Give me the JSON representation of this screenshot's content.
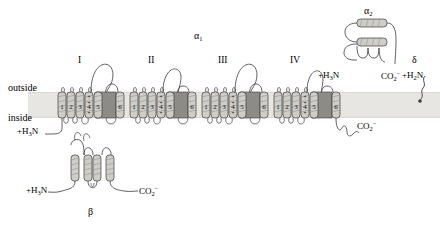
{
  "figure": {
    "membrane": {
      "outside_label": "outside",
      "inside_label": "inside",
      "band_color": "#e8e6e2",
      "band_top": 92,
      "band_height": 26
    },
    "colors": {
      "helix_fill": "#cfcdc8",
      "pore_fill": "#8d8b86",
      "outline": "#3a3a3a",
      "membrane": "#e8e6e2",
      "background": "#ffffff"
    }
  },
  "alpha1": {
    "label": "α",
    "label_sub": "1",
    "n_terminus": "+H",
    "n_terminus_sub": "3",
    "n_terminus_tail": "N",
    "c_terminus": "CO",
    "c_terminus_sub": "2",
    "c_terminus_sup": "−",
    "repeats": [
      {
        "numeral": "I",
        "x": 62
      },
      {
        "numeral": "II",
        "x": 133
      },
      {
        "numeral": "III",
        "x": 205
      },
      {
        "numeral": "IV",
        "x": 276
      }
    ],
    "segments": [
      "1",
      "2",
      "3",
      "4",
      "5",
      "6"
    ],
    "voltage_sensor_segment": "4",
    "voltage_sensor_charges": [
      "+",
      "+",
      "+"
    ],
    "pore_segment_note": "P-loop between 5 and 6"
  },
  "alpha2": {
    "label": "α",
    "label_sub": "2",
    "n_terminus": "+H",
    "n_terminus_sub": "3",
    "n_terminus_tail": "N",
    "c_terminus": "CO",
    "c_terminus_sub": "2",
    "c_terminus_sup": "−",
    "helix_count": 2
  },
  "delta": {
    "label": "δ",
    "n_terminus": "+H",
    "n_terminus_sub": "2",
    "n_terminus_tail": "N",
    "anchor": "lipid-anchor"
  },
  "beta": {
    "label": "β",
    "n_terminus": "+H",
    "n_terminus_sub": "3",
    "n_terminus_tail": "N",
    "c_terminus": "CO",
    "c_terminus_sub": "2",
    "c_terminus_sup": "−",
    "helix_count": 4
  }
}
